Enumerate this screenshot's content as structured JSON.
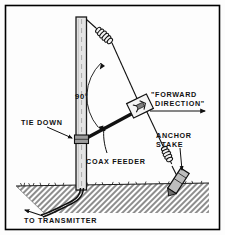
{
  "figure": {
    "background_color": "#fdfdfd",
    "ink_color": "#111111",
    "border_color": "#000000",
    "ground_fill": "#b9b9b9"
  },
  "labels": {
    "angle": "90°",
    "tie_down": "TIE DOWN",
    "coax_feeder": "COAX FEEDER",
    "forward_direction_line1": "\"FORWARD",
    "forward_direction_line2": "DIRECTION\"",
    "anchor_stake_line1": "ANCHOR",
    "anchor_stake_line2": "STAKE",
    "to_transmitter": "TO TRANSMITTER"
  },
  "components": {
    "mast": "vertical wooden mast",
    "upper_insulator": "coil spring insulator on antenna wire",
    "lower_insulator": "coil spring insulator above anchor stake",
    "center_connector": "coax to antenna junction box",
    "tie_down_clamp": "mast clamp bracket",
    "anchor_stake": "ground anchor stake",
    "ground": "hatched soil cross-section",
    "feed_line": "coax cable buried to transmitter"
  }
}
